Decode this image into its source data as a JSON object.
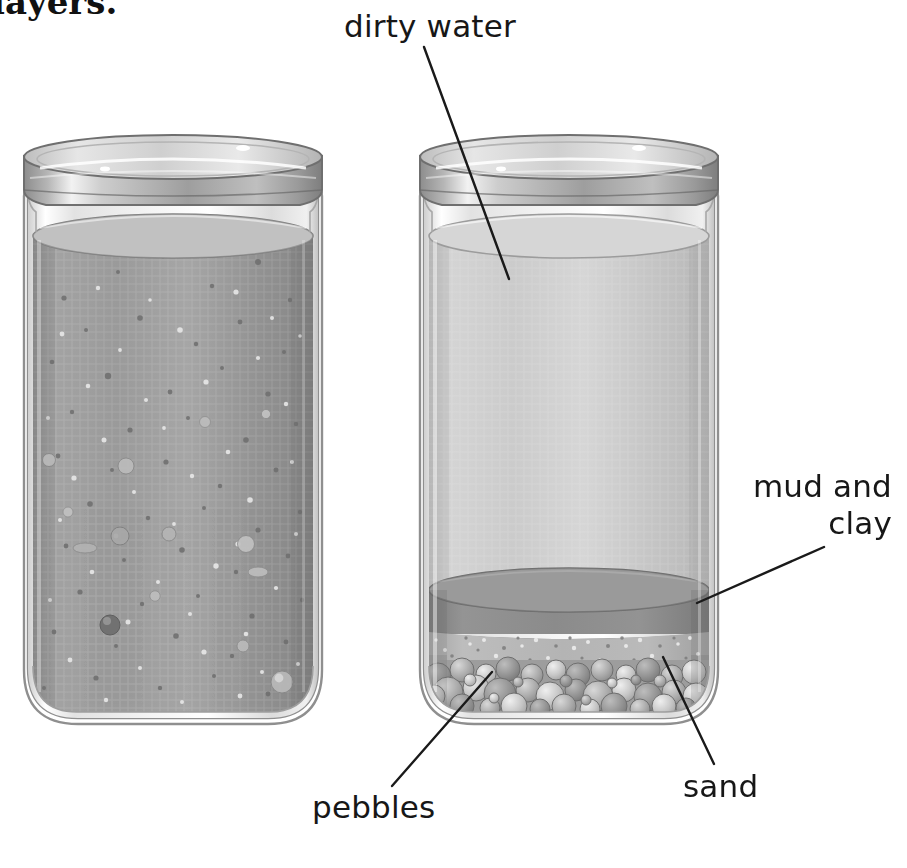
{
  "figure": {
    "title_fragment": "layers.",
    "background_color": "#ffffff",
    "line_color": "#1a1a1a",
    "text_color": "#171717"
  },
  "labels": [
    {
      "id": "dirty-water",
      "text": "dirty water",
      "lines": [
        "dirty water"
      ]
    },
    {
      "id": "mud-and-clay",
      "text": "mud and clay",
      "lines": [
        "mud and",
        "clay"
      ]
    },
    {
      "id": "sand",
      "text": "sand",
      "lines": [
        "sand"
      ]
    },
    {
      "id": "pebbles",
      "text": "pebbles",
      "lines": [
        "pebbles"
      ]
    }
  ],
  "leader_lines": [
    {
      "id": "leader-dirty-water",
      "from": [
        424,
        47
      ],
      "to": [
        509,
        279
      ],
      "target": "dirty-water"
    },
    {
      "id": "leader-mud-and-clay",
      "from": [
        824,
        547
      ],
      "to": [
        697,
        603
      ],
      "target": "mud-and-clay"
    },
    {
      "id": "leader-sand",
      "from": [
        714,
        764
      ],
      "to": [
        663,
        657
      ],
      "target": "sand"
    },
    {
      "id": "leader-pebbles",
      "from": [
        392,
        786
      ],
      "to": [
        492,
        672
      ],
      "target": "pebbles"
    }
  ],
  "jars": [
    {
      "id": "jar-left",
      "name": "jar-dirty-water",
      "contents": "dirty water, unsettled",
      "bounds": {
        "x": 17,
        "y": 143,
        "width": 312,
        "height": 582
      },
      "lid": {
        "color_top": "#d2d2d2",
        "color_band": "#8e8e8e",
        "y": 145,
        "height": 48
      },
      "water": {
        "fill": "#9b9b9b",
        "surface": "#a9a9a9",
        "top_y": 232
      },
      "particles": 120
    },
    {
      "id": "jar-right",
      "name": "jar-settled-layers",
      "contents": "settled layers",
      "bounds": {
        "x": 413,
        "y": 143,
        "width": 312,
        "height": 582
      },
      "lid": {
        "color_top": "#d2d2d2",
        "color_band": "#8e8e8e",
        "y": 145,
        "height": 48
      },
      "water": {
        "fill": "#c9c9c9",
        "surface": "#d3d3d3",
        "top_y": 232
      },
      "layers": [
        {
          "name": "clear-water",
          "color": "#c9c9c9",
          "top_y": 232,
          "bottom_y": 588
        },
        {
          "name": "mud-and-clay",
          "color": "#8a8a8a",
          "top_y": 588,
          "bottom_y": 631
        },
        {
          "name": "sand",
          "color": "#b0b0b0",
          "top_y": 631,
          "bottom_y": 672
        },
        {
          "name": "pebbles",
          "color": "#9e9e9e",
          "top_y": 666,
          "bottom_y": 716
        }
      ],
      "pebble_count": 64
    }
  ],
  "colors": {
    "glass_edge": "#9a9a9a",
    "glass_highlight": "#ffffff",
    "lid_dark": "#7c7c7c",
    "lid_light": "#e0e0e0",
    "dirty_water": "#9b9b9b",
    "clear_water": "#c9c9c9",
    "mud_clay": "#8a8a8a",
    "sand": "#b2b2b2",
    "pebble": "#a0a0a0"
  }
}
